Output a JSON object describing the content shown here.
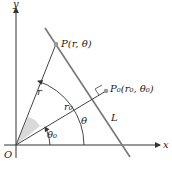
{
  "diagram": {
    "type": "polar-line-geometry",
    "axes": {
      "x_label": "x",
      "y_label": "y",
      "origin_label": "O"
    },
    "points": {
      "P": {
        "label": "P(r, θ)"
      },
      "P0": {
        "label": "P₀(r₀, θ₀)"
      }
    },
    "segments": {
      "r": {
        "label": "r"
      },
      "r0": {
        "label": "r₀"
      },
      "L": {
        "label": "L"
      }
    },
    "angles": {
      "theta": {
        "label": "θ"
      },
      "theta0": {
        "label": "θ₀"
      }
    },
    "colors": {
      "line": "#444444",
      "line_L": "#777777",
      "point": "#999999",
      "shade": "#d9d9d9"
    }
  }
}
